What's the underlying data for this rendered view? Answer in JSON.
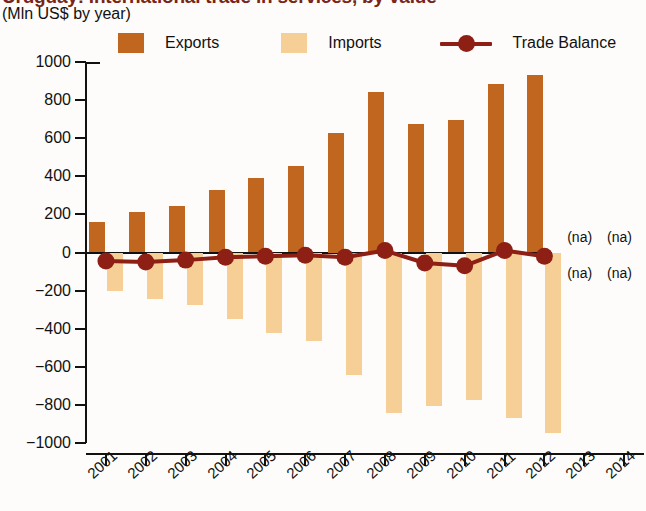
{
  "header": {
    "title": "Uruguay: International trade in services, by value",
    "subtitle": "(Mln US$ by year)"
  },
  "legend": {
    "position": "top",
    "items": [
      {
        "label": "Exports",
        "color": "#c1661f",
        "marker": "square"
      },
      {
        "label": "Imports",
        "color": "#f6cf96",
        "marker": "square"
      },
      {
        "label": "Trade Balance",
        "color": "#8d1f14",
        "marker": "line-dot"
      }
    ]
  },
  "annotations": {
    "na_above": [
      "(na)",
      "(na)"
    ],
    "na_below": [
      "(na)",
      "(na)"
    ]
  },
  "axis": {
    "y_ticks": [
      "1000",
      "800",
      "600",
      "400",
      "200",
      "0",
      "−200",
      "−400",
      "−600",
      "−800",
      "−1000"
    ],
    "x_ticks": [
      "2001",
      "2002",
      "2003",
      "2004",
      "2005",
      "2006",
      "2007",
      "2008",
      "2009",
      "2010",
      "2011",
      "2012",
      "2013",
      "2014"
    ]
  },
  "chart_data": {
    "type": "bar",
    "title": "Uruguay: International trade in services, by value",
    "subtitle": "(Mln US$ by year)",
    "xlabel": "",
    "ylabel": "Mln US$",
    "ylim": [
      -1000,
      1000
    ],
    "ytick_step": 200,
    "grid": false,
    "legend_position": "top",
    "categories": [
      "2001",
      "2002",
      "2003",
      "2004",
      "2005",
      "2006",
      "2007",
      "2008",
      "2009",
      "2010",
      "2011",
      "2012",
      "2013",
      "2014"
    ],
    "series": [
      {
        "name": "Exports",
        "type": "bar",
        "color": "#c1661f",
        "values": [
          160,
          215,
          245,
          330,
          390,
          455,
          625,
          845,
          675,
          695,
          885,
          930,
          null,
          null
        ]
      },
      {
        "name": "Imports",
        "type": "bar",
        "color": "#f6cf96",
        "values": [
          -200,
          -245,
          -275,
          -350,
          -420,
          -465,
          -645,
          -840,
          -805,
          -775,
          -870,
          -945,
          null,
          null
        ]
      },
      {
        "name": "Trade Balance",
        "type": "line",
        "color": "#8d1f14",
        "values": [
          -45,
          -50,
          -40,
          -25,
          -20,
          -15,
          -25,
          10,
          -55,
          -70,
          10,
          -20,
          null,
          null
        ]
      }
    ]
  }
}
